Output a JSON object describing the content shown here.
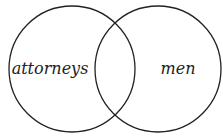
{
  "diagram": {
    "type": "venn",
    "sets": [
      {
        "label": "attorneys",
        "cx": 72,
        "cy": 69,
        "r": 63
      },
      {
        "label": "men",
        "cx": 158,
        "cy": 69,
        "r": 63
      }
    ],
    "stroke_color": "#222222",
    "background": "#ffffff"
  }
}
